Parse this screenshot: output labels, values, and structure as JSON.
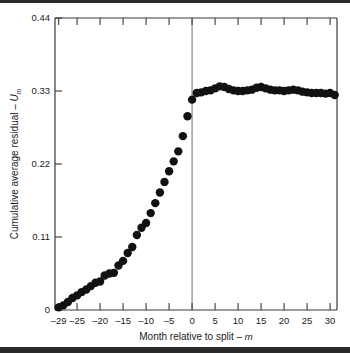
{
  "figure": {
    "name": "cumulative-average-residual-split-event-study",
    "background_color": "#ffffff",
    "frame_color": "#2b2b2b",
    "marker_color": "#111111",
    "axis_color": "#3a3a3a",
    "split_line_color": "#9a9a9a"
  },
  "chart_data": {
    "type": "scatter",
    "title": "",
    "subtitle": "",
    "xlabel": "Month relative to split – m",
    "ylabel": "Cumulative average residual – U",
    "ylabel_prefix": "Cumulative average residual – ",
    "ylabel_symbol": "U",
    "ylabel_symbol_sub": "m",
    "xlabel_prefix": "Month relative to split – ",
    "xlabel_symbol": "m",
    "xlim": [
      -29.8,
      31.5
    ],
    "ylim": [
      0,
      0.44
    ],
    "grid": false,
    "legend": false,
    "legend_position": "none",
    "x_tick_labels": [
      "–29",
      "–25",
      "–20",
      "–15",
      "–10",
      "–5",
      "0",
      "5",
      "10",
      "15",
      "20",
      "25",
      "30"
    ],
    "x_tick_values": [
      -29,
      -25,
      -20,
      -15,
      -10,
      -5,
      0,
      5,
      10,
      15,
      20,
      25,
      30
    ],
    "y_tick_labels": [
      "0",
      "0.11",
      "0.22",
      "0.33",
      "0.44"
    ],
    "y_tick_values": [
      0,
      0.11,
      0.22,
      0.33,
      0.44
    ],
    "annotations": [
      {
        "name": "split-reference-line",
        "type": "vline",
        "x": 0,
        "label": ""
      }
    ],
    "series": [
      {
        "name": "Cumulative average residual",
        "marker": "filled-circle",
        "marker_size": 4.2,
        "color": "#111111",
        "x": [
          -29,
          -28,
          -27,
          -26,
          -25,
          -24,
          -23,
          -22,
          -21,
          -20,
          -19,
          -18,
          -17,
          -16,
          -15,
          -14,
          -13,
          -12,
          -11,
          -10,
          -9,
          -8,
          -7,
          -6,
          -5,
          -4,
          -3,
          -2,
          -1,
          0,
          1,
          2,
          3,
          4,
          5,
          6,
          7,
          8,
          9,
          10,
          11,
          12,
          13,
          14,
          15,
          16,
          17,
          18,
          19,
          20,
          21,
          22,
          23,
          24,
          25,
          26,
          27,
          28,
          29,
          30,
          31
        ],
        "y": [
          0.004,
          0.007,
          0.012,
          0.018,
          0.022,
          0.027,
          0.031,
          0.036,
          0.041,
          0.043,
          0.052,
          0.055,
          0.056,
          0.067,
          0.074,
          0.086,
          0.095,
          0.113,
          0.124,
          0.131,
          0.146,
          0.161,
          0.177,
          0.193,
          0.209,
          0.224,
          0.239,
          0.262,
          0.292,
          0.317,
          0.327,
          0.328,
          0.33,
          0.331,
          0.334,
          0.337,
          0.336,
          0.333,
          0.331,
          0.33,
          0.33,
          0.331,
          0.332,
          0.335,
          0.336,
          0.334,
          0.332,
          0.331,
          0.331,
          0.33,
          0.331,
          0.332,
          0.331,
          0.329,
          0.328,
          0.327,
          0.327,
          0.327,
          0.326,
          0.327,
          0.324
        ]
      }
    ]
  }
}
